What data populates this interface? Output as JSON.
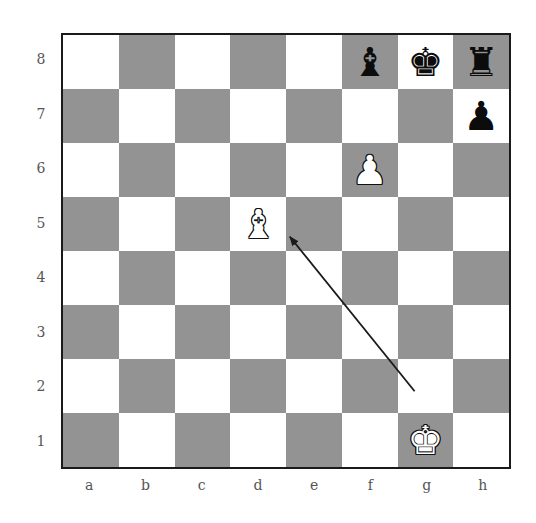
{
  "diagram": {
    "type": "chess-position",
    "files": [
      "a",
      "b",
      "c",
      "d",
      "e",
      "f",
      "g",
      "h"
    ],
    "ranks": [
      "8",
      "7",
      "6",
      "5",
      "4",
      "3",
      "2",
      "1"
    ],
    "colors": {
      "light_square": "#ffffff",
      "dark_square": "#939393",
      "border": "#1a1a1a",
      "arrow": "#1a1a1a"
    },
    "pieces": [
      {
        "square": "f8",
        "color": "black",
        "type": "bishop",
        "glyph": "♝"
      },
      {
        "square": "g8",
        "color": "black",
        "type": "king",
        "glyph": "♚"
      },
      {
        "square": "h8",
        "color": "black",
        "type": "rook",
        "glyph": "♜"
      },
      {
        "square": "h7",
        "color": "black",
        "type": "pawn",
        "glyph": "♟"
      },
      {
        "square": "f6",
        "color": "white",
        "type": "pawn",
        "glyph": "♟"
      },
      {
        "square": "d5",
        "color": "white",
        "type": "bishop",
        "glyph": "♝"
      },
      {
        "square": "g1",
        "color": "white",
        "type": "king",
        "glyph": "♚"
      }
    ],
    "arrows": [
      {
        "from": "g2",
        "to": "d5"
      }
    ]
  }
}
